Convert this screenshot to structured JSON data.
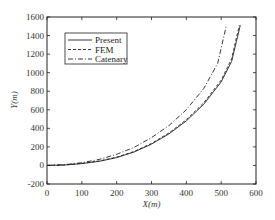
{
  "chart_data": {
    "type": "line",
    "title": "",
    "xlabel": "X(m)",
    "ylabel": "Y(m)",
    "xlim": [
      0,
      600
    ],
    "ylim": [
      -200,
      1600
    ],
    "xticks": [
      0,
      100,
      200,
      300,
      400,
      500,
      600
    ],
    "yticks": [
      -200,
      0,
      200,
      400,
      600,
      800,
      1000,
      1200,
      1400,
      1600
    ],
    "grid": false,
    "legend_position": "top-left",
    "series": [
      {
        "name": "Present",
        "style": "solid",
        "x": [
          0,
          50,
          100,
          150,
          200,
          250,
          300,
          350,
          400,
          450,
          500,
          530,
          555
        ],
        "y": [
          0,
          5,
          20,
          45,
          85,
          145,
          230,
          340,
          480,
          660,
          900,
          1120,
          1510
        ]
      },
      {
        "name": "FEM",
        "style": "dashed",
        "x": [
          0,
          50,
          100,
          150,
          200,
          250,
          300,
          350,
          400,
          450,
          500,
          530,
          552
        ],
        "y": [
          0,
          5,
          22,
          48,
          90,
          150,
          238,
          350,
          492,
          675,
          920,
          1150,
          1510
        ]
      },
      {
        "name": "Catenary",
        "style": "dashdot",
        "x": [
          0,
          50,
          100,
          150,
          200,
          250,
          300,
          350,
          400,
          450,
          490,
          515
        ],
        "y": [
          0,
          8,
          30,
          65,
          120,
          195,
          300,
          430,
          600,
          830,
          1100,
          1510
        ]
      }
    ]
  }
}
